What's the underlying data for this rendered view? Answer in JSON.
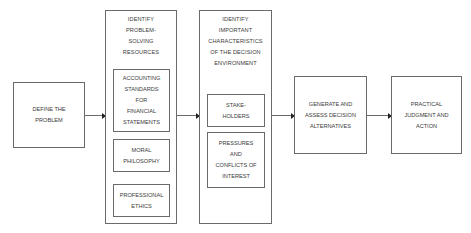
{
  "diagram": {
    "type": "flowchart",
    "direction": "left-to-right",
    "colors": {
      "border": "#6a6a6a",
      "text": "#3a3a3a",
      "arrowhead": "#222222",
      "background": "#ffffff"
    },
    "nodes": {
      "define": {
        "lines": [
          "DEFINE THE",
          "PROBLEM"
        ]
      },
      "resources": {
        "title_lines": [
          "IDENTIFY",
          "PROBLEM-",
          "SOLVING",
          "RESOURCES"
        ],
        "children": [
          {
            "lines": [
              "ACCOUNTING",
              "STANDARDS",
              "FOR",
              "FINANCIAL",
              "STATEMENTS"
            ]
          },
          {
            "lines": [
              "MORAL",
              "PHILOSOPHY"
            ]
          },
          {
            "lines": [
              "PROFESSIONAL",
              "ETHICS"
            ]
          }
        ]
      },
      "environment": {
        "title_lines": [
          "IDENTIFY",
          "IMPORTANT",
          "CHARACTERISTICS",
          "OF THE DECISION",
          "ENVIRONMENT"
        ],
        "children": [
          {
            "lines": [
              "STAKE-",
              "HOLDERS"
            ]
          },
          {
            "lines": [
              "PRESSURES",
              "AND",
              "CONFLICTS OF",
              "INTEREST"
            ]
          }
        ]
      },
      "alternatives": {
        "lines": [
          "GENERATE AND",
          "ASSESS DECISION",
          "ALTERNATIVES"
        ]
      },
      "action": {
        "lines": [
          "PRACTICAL",
          "JUDGMENT AND",
          "ACTION"
        ]
      }
    },
    "edges": [
      {
        "from": "define",
        "to": "resources"
      },
      {
        "from": "resources",
        "to": "environment"
      },
      {
        "from": "environment",
        "to": "alternatives"
      },
      {
        "from": "alternatives",
        "to": "action"
      }
    ]
  }
}
